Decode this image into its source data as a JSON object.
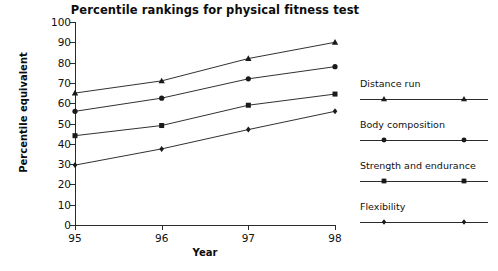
{
  "chart_data": {
    "type": "line",
    "title": "Percentile rankings for physical fitness test",
    "xlabel": "Year",
    "ylabel": "Percentile equivalent",
    "categories": [
      "95",
      "96",
      "97",
      "98"
    ],
    "x": [
      95,
      96,
      97,
      98
    ],
    "ylim": [
      0,
      100
    ],
    "yticks": [
      0,
      10,
      20,
      30,
      40,
      50,
      60,
      70,
      80,
      90,
      100
    ],
    "ytick_labels": [
      "0",
      "10",
      "20",
      "30",
      "40",
      "50",
      "60",
      "70",
      "80",
      "90",
      "100"
    ],
    "grid": false,
    "legend_position": "right",
    "series": [
      {
        "name": "Distance run",
        "marker": "triangle",
        "color": "#1a1a1a",
        "values": [
          65,
          71,
          82,
          90
        ]
      },
      {
        "name": "Body composition",
        "marker": "circle",
        "color": "#1a1a1a",
        "values": [
          56,
          62.5,
          72,
          78
        ]
      },
      {
        "name": "Strength and endurance",
        "marker": "square",
        "color": "#1a1a1a",
        "values": [
          44,
          49,
          59,
          64.5
        ]
      },
      {
        "name": "Flexibility",
        "marker": "diamond",
        "color": "#1a1a1a",
        "values": [
          29.5,
          37.5,
          47,
          56
        ]
      }
    ]
  },
  "legend": {
    "entries": [
      {
        "label": "Distance run",
        "marker": "triangle"
      },
      {
        "label": "Body composition",
        "marker": "circle"
      },
      {
        "label": "Strength and endurance",
        "marker": "square"
      },
      {
        "label": "Flexibility",
        "marker": "diamond"
      }
    ]
  },
  "colors": {
    "axis": "#2b2b2b",
    "text": "#111111",
    "marker": "#1a1a1a",
    "background": "#ffffff"
  }
}
